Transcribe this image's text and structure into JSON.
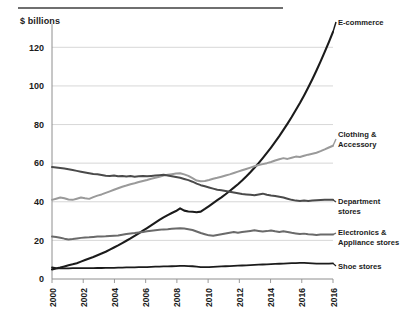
{
  "figure": {
    "unit_label": "$ billions",
    "has_top_rule": true
  },
  "chart_data": {
    "type": "line",
    "title": "",
    "subtitle": "",
    "xlabel": "",
    "ylabel": "$ billions",
    "ylim": [
      0,
      130
    ],
    "xlim": [
      2000,
      2017
    ],
    "grid": "horizontal",
    "legend_position": "right-inline",
    "y_ticks": [
      0,
      20,
      40,
      60,
      80,
      100,
      120
    ],
    "y_tick_labels": [
      "0",
      "20",
      "40",
      "60",
      "80",
      "100",
      "120"
    ],
    "x_ticks": [
      2000,
      2002,
      2004,
      2006,
      2008,
      2010,
      2012,
      2014,
      2016,
      2016
    ],
    "x_tick_labels": [
      "2000",
      "2002",
      "2004",
      "2006",
      "2008",
      "2010",
      "2012",
      "2014",
      "2016",
      "2016"
    ],
    "x": [
      2000,
      2000.25,
      2000.5,
      2000.75,
      2001,
      2001.25,
      2001.5,
      2001.75,
      2002,
      2002.25,
      2002.5,
      2002.75,
      2003,
      2003.25,
      2003.5,
      2003.75,
      2004,
      2004.25,
      2004.5,
      2004.75,
      2005,
      2005.25,
      2005.5,
      2005.75,
      2006,
      2006.25,
      2006.5,
      2006.75,
      2007,
      2007.25,
      2007.5,
      2007.75,
      2008,
      2008.25,
      2008.5,
      2008.75,
      2009,
      2009.25,
      2009.5,
      2009.75,
      2010,
      2010.25,
      2010.5,
      2010.75,
      2011,
      2011.25,
      2011.5,
      2011.75,
      2012,
      2012.25,
      2012.5,
      2012.75,
      2013,
      2013.25,
      2013.5,
      2013.75,
      2014,
      2014.25,
      2014.5,
      2014.75,
      2015,
      2015.25,
      2015.5,
      2015.75,
      2016,
      2016.25,
      2016.5,
      2016.75,
      2017
    ],
    "series": [
      {
        "name": "E-commerce",
        "color": "#1b1b1b",
        "width": 2.1,
        "label_lines": [
          "E-commerce"
        ],
        "start_value": 5,
        "end_value": 128,
        "values": [
          5,
          5.4,
          5.9,
          6.5,
          7.1,
          7.6,
          8.2,
          9.0,
          9.8,
          10.6,
          11.4,
          12.3,
          13.2,
          14.1,
          15.2,
          16.3,
          17.4,
          18.6,
          19.8,
          21.0,
          22.3,
          23.6,
          25.0,
          26.4,
          27.8,
          29.2,
          30.6,
          31.9,
          33.1,
          34.2,
          35.2,
          36.6,
          35.4,
          35.0,
          34.8,
          34.6,
          34.9,
          36.3,
          37.8,
          39.3,
          40.8,
          42.3,
          43.9,
          45.6,
          47.3,
          49.1,
          51.0,
          53.1,
          55.3,
          57.6,
          60.0,
          62.6,
          65.3,
          68.1,
          71.0,
          74.0,
          77.2,
          80.5,
          83.9,
          87.5,
          91.2,
          95.1,
          99.2,
          103.5,
          108.0,
          112.7,
          117.6,
          122.7,
          128.0
        ]
      },
      {
        "name": "Clothing & Accessory",
        "color": "#9a9a9a",
        "width": 2.0,
        "label_lines": [
          "Clothing &",
          "Accessory"
        ],
        "start_value": 41,
        "end_value": 69,
        "values": [
          41,
          41.6,
          42.2,
          41.8,
          41.2,
          41.0,
          41.6,
          42.2,
          41.8,
          41.5,
          42.4,
          43.2,
          43.8,
          44.6,
          45.4,
          46.2,
          47.0,
          47.8,
          48.4,
          49.1,
          49.6,
          50.2,
          50.8,
          51.3,
          51.9,
          52.4,
          53.0,
          53.6,
          54.0,
          54.3,
          54.6,
          54.8,
          54.2,
          53.4,
          52.2,
          51.0,
          50.6,
          50.8,
          51.3,
          51.9,
          52.4,
          53.0,
          53.6,
          54.2,
          54.9,
          55.6,
          56.3,
          57.0,
          57.7,
          58.4,
          59.0,
          59.5,
          60.0,
          60.6,
          61.4,
          62.0,
          62.6,
          62.2,
          62.8,
          63.4,
          63.2,
          63.8,
          64.4,
          64.9,
          65.4,
          66.2,
          67.1,
          68.1,
          69.0
        ]
      },
      {
        "name": "Department stores",
        "color": "#4a4a4a",
        "width": 2.0,
        "label_lines": [
          "Department",
          "stores"
        ],
        "start_value": 58,
        "end_value": 41,
        "values": [
          58,
          57.8,
          57.5,
          57.2,
          56.8,
          56.4,
          56.0,
          55.6,
          55.2,
          54.8,
          54.4,
          54.3,
          53.9,
          53.5,
          53.4,
          53.6,
          53.2,
          53.4,
          53.1,
          53.3,
          53.0,
          53.2,
          53.4,
          53.2,
          53.4,
          53.6,
          53.8,
          54.0,
          53.6,
          53.2,
          52.8,
          52.4,
          51.8,
          51.2,
          50.4,
          49.4,
          48.6,
          48.0,
          47.4,
          46.8,
          46.2,
          46.0,
          45.6,
          45.2,
          44.8,
          44.4,
          44.0,
          43.8,
          43.6,
          43.4,
          43.8,
          44.2,
          43.6,
          43.2,
          43.0,
          42.6,
          42.2,
          41.6,
          41.0,
          40.6,
          40.4,
          40.6,
          40.4,
          40.6,
          40.8,
          40.9,
          41.0,
          41.0,
          41.0
        ]
      },
      {
        "name": "Electronics & Appliance stores",
        "color": "#6a6a6a",
        "width": 2.0,
        "label_lines": [
          "Electronics &",
          "Appliance stores"
        ],
        "start_value": 22,
        "end_value": 23,
        "values": [
          22,
          21.8,
          21.4,
          20.9,
          20.5,
          20.7,
          21.0,
          21.3,
          21.5,
          21.6,
          21.8,
          22.0,
          22.0,
          22.1,
          22.3,
          22.4,
          22.5,
          22.9,
          23.3,
          23.6,
          23.8,
          24.1,
          24.4,
          24.7,
          25.0,
          25.3,
          25.5,
          25.7,
          25.8,
          26.0,
          26.2,
          26.3,
          26.1,
          25.8,
          25.4,
          24.6,
          23.8,
          23.2,
          22.6,
          22.4,
          22.8,
          23.2,
          23.6,
          24.0,
          24.3,
          24.0,
          24.3,
          24.6,
          24.9,
          25.2,
          24.9,
          24.6,
          24.8,
          25.1,
          24.7,
          24.4,
          24.7,
          24.3,
          23.9,
          23.6,
          23.3,
          23.5,
          23.2,
          23.0,
          22.8,
          23.0,
          23.1,
          23.0,
          23.0
        ]
      },
      {
        "name": "Shoe stores",
        "color": "#1b1b1b",
        "width": 1.8,
        "label_lines": [
          "Shoe stores"
        ],
        "start_value": 6,
        "end_value": 8,
        "values": [
          6,
          5.6,
          5.5,
          5.5,
          5.5,
          5.6,
          5.6,
          5.6,
          5.6,
          5.6,
          5.6,
          5.7,
          5.7,
          5.8,
          5.8,
          5.8,
          5.9,
          5.9,
          6.0,
          6.0,
          6.0,
          6.1,
          6.2,
          6.2,
          6.3,
          6.4,
          6.4,
          6.5,
          6.5,
          6.6,
          6.7,
          6.8,
          6.8,
          6.7,
          6.6,
          6.4,
          6.2,
          6.1,
          6.2,
          6.3,
          6.4,
          6.5,
          6.6,
          6.7,
          6.8,
          6.9,
          7.0,
          7.1,
          7.2,
          7.3,
          7.4,
          7.5,
          7.6,
          7.7,
          7.8,
          7.9,
          8.0,
          8.1,
          8.2,
          8.2,
          8.3,
          8.3,
          8.2,
          8.1,
          8.0,
          8.0,
          8.0,
          8.0,
          8.1
        ]
      }
    ]
  },
  "labels": {
    "e_commerce": "E-commerce",
    "clothing": "Clothing &\nAccessory",
    "department": "Department\nstores",
    "electronics": "Electronics &\nAppliance stores",
    "shoe": "Shoe stores"
  }
}
